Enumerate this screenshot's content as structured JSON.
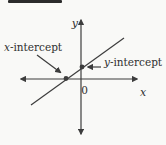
{
  "diagram": {
    "labels": {
      "y_axis": "y",
      "x_axis": "x",
      "origin": "0",
      "x_intercept": {
        "var": "x",
        "rest": "-intercept"
      },
      "y_intercept": {
        "var": "y",
        "rest": "-intercept"
      }
    },
    "colors": {
      "line": "#3d3d3d",
      "text": "#2f2f2f",
      "background": "#f9f9f7",
      "top_bar": "#2b2b2b"
    }
  }
}
